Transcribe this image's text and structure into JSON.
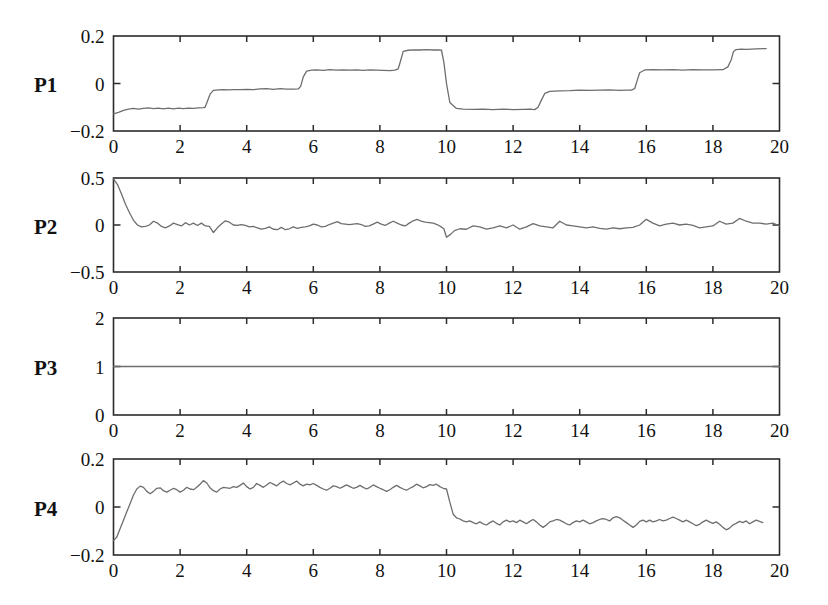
{
  "figure": {
    "width": 828,
    "height": 605,
    "background": "#ffffff",
    "line_color": "#6e6e6e",
    "axis_color": "#2b2b2b"
  },
  "chart_data": [
    {
      "type": "line",
      "title": "",
      "panel_label": "P1",
      "xlabel": "",
      "ylabel": "P1",
      "xlim": [
        0,
        20
      ],
      "ylim": [
        -0.2,
        0.2
      ],
      "xticks": [
        0,
        2,
        4,
        6,
        8,
        10,
        12,
        14,
        16,
        18,
        20
      ],
      "xtick_labels": [
        "0",
        "2",
        "4",
        "6",
        "8",
        "10",
        "12",
        "14",
        "16",
        "18",
        "20"
      ],
      "yticks": [
        -0.2,
        0,
        0.2
      ],
      "ytick_labels": [
        "-0.2",
        "0",
        "0.2"
      ],
      "grid": false,
      "legend": null,
      "x": [
        0.0,
        0.15,
        0.3,
        0.45,
        0.6,
        0.75,
        0.9,
        1.05,
        1.2,
        1.35,
        1.5,
        1.65,
        1.8,
        1.95,
        2.1,
        2.25,
        2.4,
        2.55,
        2.7,
        2.75,
        2.82,
        2.9,
        3.0,
        3.15,
        3.3,
        3.45,
        3.6,
        3.8,
        4.0,
        4.2,
        4.4,
        4.6,
        4.8,
        5.0,
        5.2,
        5.4,
        5.55,
        5.62,
        5.7,
        5.8,
        5.95,
        6.1,
        6.3,
        6.5,
        6.7,
        6.9,
        7.1,
        7.3,
        7.5,
        7.7,
        7.9,
        8.1,
        8.3,
        8.45,
        8.55,
        8.62,
        8.7,
        8.85,
        9.0,
        9.2,
        9.4,
        9.6,
        9.75,
        9.85,
        9.92,
        10.0,
        10.1,
        10.3,
        10.5,
        10.8,
        11.1,
        11.4,
        11.7,
        12.0,
        12.3,
        12.5,
        12.65,
        12.75,
        12.85,
        12.95,
        13.1,
        13.4,
        13.7,
        14.0,
        14.3,
        14.6,
        14.9,
        15.2,
        15.4,
        15.55,
        15.65,
        15.72,
        15.8,
        15.95,
        16.2,
        16.5,
        16.8,
        17.1,
        17.4,
        17.7,
        18.0,
        18.3,
        18.45,
        18.55,
        18.62,
        18.7,
        18.85,
        19.0,
        19.3,
        19.6,
        20.0
      ],
      "values": [
        -0.128,
        -0.122,
        -0.113,
        -0.108,
        -0.105,
        -0.108,
        -0.105,
        -0.103,
        -0.106,
        -0.104,
        -0.107,
        -0.104,
        -0.107,
        -0.104,
        -0.106,
        -0.104,
        -0.105,
        -0.103,
        -0.102,
        -0.1,
        -0.075,
        -0.045,
        -0.029,
        -0.027,
        -0.026,
        -0.027,
        -0.026,
        -0.026,
        -0.025,
        -0.026,
        -0.023,
        -0.022,
        -0.025,
        -0.022,
        -0.024,
        -0.024,
        -0.023,
        -0.012,
        0.028,
        0.052,
        0.056,
        0.057,
        0.055,
        0.058,
        0.056,
        0.057,
        0.056,
        0.057,
        0.055,
        0.057,
        0.056,
        0.055,
        0.054,
        0.056,
        0.062,
        0.095,
        0.135,
        0.14,
        0.142,
        0.141,
        0.143,
        0.141,
        0.142,
        0.14,
        0.09,
        0.0,
        -0.08,
        -0.105,
        -0.108,
        -0.109,
        -0.108,
        -0.11,
        -0.108,
        -0.11,
        -0.109,
        -0.108,
        -0.11,
        -0.1,
        -0.07,
        -0.042,
        -0.033,
        -0.031,
        -0.03,
        -0.028,
        -0.029,
        -0.028,
        -0.027,
        -0.029,
        -0.028,
        -0.028,
        -0.022,
        0.01,
        0.045,
        0.057,
        0.058,
        0.057,
        0.058,
        0.056,
        0.058,
        0.057,
        0.057,
        0.058,
        0.07,
        0.1,
        0.135,
        0.143,
        0.145,
        0.144,
        0.146,
        0.147
      ]
    },
    {
      "type": "line",
      "title": "",
      "panel_label": "P2",
      "xlabel": "",
      "ylabel": "P2",
      "xlim": [
        0,
        20
      ],
      "ylim": [
        -0.5,
        0.5
      ],
      "xticks": [
        0,
        2,
        4,
        6,
        8,
        10,
        12,
        14,
        16,
        18,
        20
      ],
      "xtick_labels": [
        "0",
        "2",
        "4",
        "6",
        "8",
        "10",
        "12",
        "14",
        "16",
        "18",
        "20"
      ],
      "yticks": [
        -0.5,
        0,
        0.5
      ],
      "ytick_labels": [
        "-0.5",
        "0",
        "0.5"
      ],
      "grid": false,
      "legend": null,
      "x": [
        0.0,
        0.12,
        0.24,
        0.36,
        0.48,
        0.6,
        0.72,
        0.84,
        0.96,
        1.08,
        1.2,
        1.32,
        1.44,
        1.56,
        1.68,
        1.8,
        1.92,
        2.04,
        2.16,
        2.28,
        2.4,
        2.52,
        2.64,
        2.76,
        2.88,
        3.0,
        3.12,
        3.24,
        3.36,
        3.48,
        3.6,
        3.72,
        3.84,
        3.96,
        4.08,
        4.2,
        4.32,
        4.44,
        4.56,
        4.68,
        4.8,
        4.92,
        5.04,
        5.16,
        5.28,
        5.4,
        5.52,
        5.64,
        5.76,
        5.88,
        6.0,
        6.12,
        6.24,
        6.36,
        6.48,
        6.6,
        6.72,
        6.84,
        6.96,
        7.08,
        7.2,
        7.32,
        7.44,
        7.56,
        7.68,
        7.8,
        7.92,
        8.04,
        8.16,
        8.28,
        8.4,
        8.52,
        8.64,
        8.76,
        8.88,
        9.0,
        9.12,
        9.24,
        9.36,
        9.48,
        9.6,
        9.72,
        9.84,
        9.92,
        10.0,
        10.12,
        10.24,
        10.4,
        10.6,
        10.8,
        11.0,
        11.2,
        11.4,
        11.6,
        11.8,
        12.0,
        12.2,
        12.4,
        12.6,
        12.8,
        13.0,
        13.2,
        13.4,
        13.6,
        13.8,
        14.0,
        14.2,
        14.4,
        14.6,
        14.8,
        15.0,
        15.2,
        15.4,
        15.6,
        15.8,
        16.0,
        16.2,
        16.4,
        16.6,
        16.8,
        17.0,
        17.2,
        17.4,
        17.6,
        17.8,
        18.0,
        18.2,
        18.4,
        18.6,
        18.8,
        19.0,
        19.2,
        19.4,
        19.6,
        19.8,
        20.0
      ],
      "values": [
        0.49,
        0.43,
        0.33,
        0.22,
        0.13,
        0.05,
        0.0,
        -0.02,
        -0.015,
        0.0,
        0.04,
        0.02,
        -0.015,
        -0.03,
        -0.01,
        0.02,
        0.005,
        -0.01,
        0.025,
        0.0,
        0.02,
        -0.005,
        0.02,
        -0.01,
        -0.015,
        -0.08,
        -0.03,
        0.01,
        0.045,
        0.03,
        0.0,
        -0.005,
        0.005,
        -0.005,
        -0.02,
        -0.015,
        -0.03,
        -0.045,
        -0.035,
        -0.02,
        -0.045,
        -0.05,
        -0.025,
        -0.05,
        -0.04,
        -0.02,
        -0.035,
        -0.025,
        -0.02,
        -0.01,
        0.01,
        0.0,
        -0.02,
        -0.015,
        0.005,
        0.02,
        0.035,
        0.015,
        0.01,
        0.005,
        0.01,
        0.015,
        0.005,
        -0.015,
        -0.01,
        0.01,
        0.03,
        0.01,
        -0.005,
        0.02,
        0.04,
        0.02,
        0.0,
        -0.01,
        0.02,
        0.045,
        0.06,
        0.04,
        0.03,
        0.025,
        0.02,
        0.005,
        -0.02,
        -0.04,
        -0.13,
        -0.1,
        -0.06,
        -0.04,
        -0.045,
        -0.01,
        -0.02,
        -0.045,
        -0.03,
        -0.01,
        -0.03,
        0.0,
        -0.045,
        -0.02,
        0.015,
        -0.01,
        -0.02,
        -0.03,
        0.04,
        0.0,
        -0.01,
        -0.02,
        -0.03,
        -0.02,
        -0.035,
        -0.045,
        -0.03,
        -0.04,
        -0.03,
        -0.025,
        0.0,
        0.06,
        0.02,
        -0.01,
        0.01,
        0.02,
        0.0,
        0.01,
        -0.005,
        -0.03,
        -0.02,
        -0.01,
        0.04,
        0.01,
        0.02,
        0.07,
        0.04,
        0.02,
        0.02,
        0.01,
        0.02,
        -0.01,
        -0.015
      ]
    },
    {
      "type": "line",
      "title": "",
      "panel_label": "P3",
      "xlabel": "",
      "ylabel": "P3",
      "xlim": [
        0,
        20
      ],
      "ylim": [
        0,
        2
      ],
      "xticks": [
        0,
        2,
        4,
        6,
        8,
        10,
        12,
        14,
        16,
        18,
        20
      ],
      "xtick_labels": [
        "0",
        "2",
        "4",
        "6",
        "8",
        "10",
        "12",
        "14",
        "16",
        "18",
        "20"
      ],
      "yticks": [
        0,
        1,
        2
      ],
      "ytick_labels": [
        "0",
        "1",
        "2"
      ],
      "grid": false,
      "legend": null,
      "x": [
        0,
        20
      ],
      "values": [
        1.0,
        1.0
      ]
    },
    {
      "type": "line",
      "title": "",
      "panel_label": "P4",
      "xlabel": "",
      "ylabel": "P4",
      "xlim": [
        0,
        20
      ],
      "ylim": [
        -0.2,
        0.2
      ],
      "xticks": [
        0,
        2,
        4,
        6,
        8,
        10,
        12,
        14,
        16,
        18,
        20
      ],
      "xtick_labels": [
        "0",
        "2",
        "4",
        "6",
        "8",
        "10",
        "12",
        "14",
        "16",
        "18",
        "20"
      ],
      "yticks": [
        -0.2,
        0,
        0.2
      ],
      "ytick_labels": [
        "-0.2",
        "0",
        "0.2"
      ],
      "grid": false,
      "legend": null,
      "x": [
        0.0,
        0.1,
        0.2,
        0.3,
        0.4,
        0.5,
        0.6,
        0.7,
        0.8,
        0.9,
        1.0,
        1.1,
        1.2,
        1.3,
        1.4,
        1.5,
        1.6,
        1.7,
        1.8,
        1.9,
        2.0,
        2.1,
        2.2,
        2.3,
        2.4,
        2.5,
        2.6,
        2.7,
        2.8,
        2.9,
        3.0,
        3.1,
        3.2,
        3.3,
        3.4,
        3.5,
        3.6,
        3.7,
        3.8,
        3.9,
        4.0,
        4.1,
        4.2,
        4.3,
        4.4,
        4.5,
        4.6,
        4.7,
        4.8,
        4.9,
        5.0,
        5.1,
        5.2,
        5.3,
        5.4,
        5.5,
        5.6,
        5.7,
        5.8,
        5.9,
        6.0,
        6.1,
        6.2,
        6.3,
        6.4,
        6.5,
        6.6,
        6.7,
        6.8,
        6.9,
        7.0,
        7.1,
        7.2,
        7.3,
        7.4,
        7.5,
        7.6,
        7.7,
        7.8,
        7.9,
        8.0,
        8.1,
        8.2,
        8.3,
        8.4,
        8.5,
        8.6,
        8.7,
        8.8,
        8.9,
        9.0,
        9.1,
        9.2,
        9.3,
        9.4,
        9.5,
        9.6,
        9.7,
        9.8,
        9.9,
        10.0,
        10.1,
        10.2,
        10.3,
        10.4,
        10.5,
        10.6,
        10.7,
        10.8,
        10.9,
        11.0,
        11.1,
        11.2,
        11.3,
        11.4,
        11.5,
        11.6,
        11.7,
        11.8,
        11.9,
        12.0,
        12.1,
        12.2,
        12.3,
        12.4,
        12.5,
        12.6,
        12.7,
        12.8,
        12.9,
        13.0,
        13.1,
        13.2,
        13.3,
        13.4,
        13.5,
        13.6,
        13.7,
        13.8,
        13.9,
        14.0,
        14.1,
        14.2,
        14.3,
        14.4,
        14.5,
        14.6,
        14.7,
        14.8,
        14.9,
        15.0,
        15.1,
        15.2,
        15.3,
        15.4,
        15.5,
        15.6,
        15.7,
        15.8,
        15.9,
        16.0,
        16.1,
        16.2,
        16.3,
        16.4,
        16.5,
        16.6,
        16.7,
        16.8,
        16.9,
        17.0,
        17.1,
        17.2,
        17.3,
        17.4,
        17.5,
        17.6,
        17.7,
        17.8,
        17.9,
        18.0,
        18.1,
        18.2,
        18.3,
        18.4,
        18.5,
        18.6,
        18.7,
        18.8,
        18.9,
        19.0,
        19.1,
        19.2,
        19.3,
        19.4,
        19.5,
        19.6,
        19.7,
        19.8,
        19.9,
        20.0
      ],
      "values": [
        -0.14,
        -0.125,
        -0.09,
        -0.055,
        -0.02,
        0.015,
        0.05,
        0.075,
        0.087,
        0.082,
        0.065,
        0.055,
        0.065,
        0.078,
        0.08,
        0.068,
        0.062,
        0.07,
        0.078,
        0.072,
        0.062,
        0.07,
        0.082,
        0.075,
        0.072,
        0.082,
        0.095,
        0.11,
        0.1,
        0.08,
        0.068,
        0.062,
        0.075,
        0.082,
        0.08,
        0.078,
        0.085,
        0.082,
        0.09,
        0.1,
        0.085,
        0.075,
        0.082,
        0.098,
        0.09,
        0.082,
        0.092,
        0.102,
        0.095,
        0.088,
        0.1,
        0.108,
        0.098,
        0.092,
        0.1,
        0.108,
        0.095,
        0.088,
        0.095,
        0.092,
        0.098,
        0.09,
        0.082,
        0.075,
        0.07,
        0.078,
        0.088,
        0.085,
        0.078,
        0.085,
        0.092,
        0.085,
        0.078,
        0.082,
        0.09,
        0.082,
        0.075,
        0.082,
        0.092,
        0.085,
        0.078,
        0.072,
        0.065,
        0.072,
        0.082,
        0.09,
        0.082,
        0.075,
        0.07,
        0.078,
        0.085,
        0.095,
        0.088,
        0.08,
        0.085,
        0.093,
        0.09,
        0.095,
        0.085,
        0.078,
        0.075,
        0.02,
        -0.03,
        -0.045,
        -0.05,
        -0.058,
        -0.062,
        -0.058,
        -0.065,
        -0.07,
        -0.062,
        -0.07,
        -0.075,
        -0.065,
        -0.058,
        -0.068,
        -0.075,
        -0.062,
        -0.055,
        -0.062,
        -0.058,
        -0.065,
        -0.055,
        -0.062,
        -0.07,
        -0.06,
        -0.052,
        -0.062,
        -0.075,
        -0.085,
        -0.075,
        -0.062,
        -0.058,
        -0.052,
        -0.055,
        -0.062,
        -0.07,
        -0.075,
        -0.065,
        -0.058,
        -0.062,
        -0.055,
        -0.062,
        -0.07,
        -0.065,
        -0.058,
        -0.052,
        -0.048,
        -0.052,
        -0.058,
        -0.045,
        -0.04,
        -0.045,
        -0.055,
        -0.065,
        -0.075,
        -0.085,
        -0.075,
        -0.06,
        -0.055,
        -0.062,
        -0.055,
        -0.062,
        -0.058,
        -0.052,
        -0.058,
        -0.055,
        -0.048,
        -0.042,
        -0.048,
        -0.055,
        -0.062,
        -0.055,
        -0.062,
        -0.07,
        -0.078,
        -0.072,
        -0.062,
        -0.055,
        -0.062,
        -0.068,
        -0.062,
        -0.072,
        -0.085,
        -0.095,
        -0.088,
        -0.075,
        -0.068,
        -0.06,
        -0.065,
        -0.058,
        -0.07,
        -0.062,
        -0.055,
        -0.06,
        -0.065
      ]
    }
  ]
}
